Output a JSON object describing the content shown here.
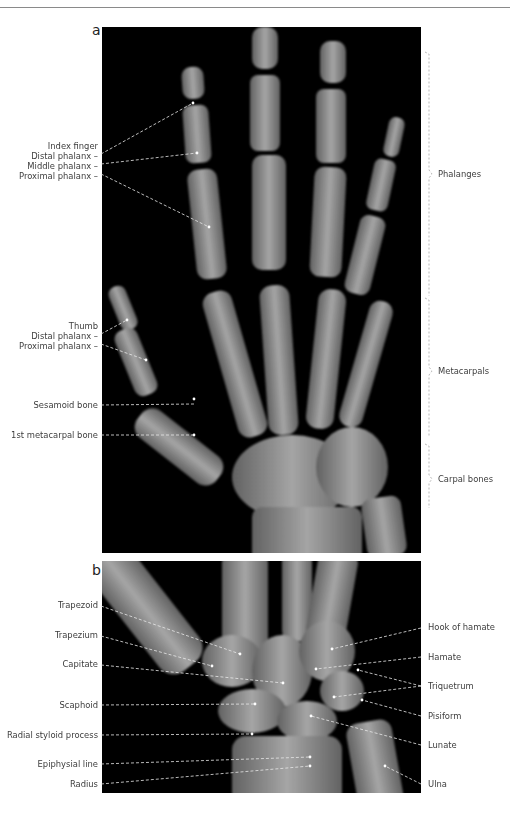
{
  "figure": {
    "panel_a": {
      "letter": "a",
      "left_labels": [
        {
          "text": "Index finger",
          "x": 98,
          "y": 141
        },
        {
          "text": "Distal phalanx –",
          "x": 98,
          "y": 151
        },
        {
          "text": "Middle phalanx –",
          "x": 98,
          "y": 161
        },
        {
          "text": "Proximal phalanx –",
          "x": 98,
          "y": 171
        },
        {
          "text": "Thumb",
          "x": 98,
          "y": 321
        },
        {
          "text": "Distal phalanx –",
          "x": 98,
          "y": 331
        },
        {
          "text": "Proximal phalanx –",
          "x": 98,
          "y": 341
        },
        {
          "text": "Sesamoid bone",
          "x": 98,
          "y": 400
        },
        {
          "text": "1st metacarpal bone",
          "x": 98,
          "y": 430
        }
      ],
      "right_labels": [
        {
          "text": "Phalanges",
          "y": 172
        },
        {
          "text": "Metacarpals",
          "y": 369
        },
        {
          "text": "Carpal bones",
          "y": 477
        }
      ]
    },
    "panel_b": {
      "letter": "b",
      "left_labels": [
        {
          "text": "Trapezoid",
          "y": 600
        },
        {
          "text": "Trapezium",
          "y": 630
        },
        {
          "text": "Capitate",
          "y": 659
        },
        {
          "text": "Scaphoid",
          "y": 701
        },
        {
          "text": "Radial styloid process",
          "y": 731
        },
        {
          "text": "Epiphysial line",
          "y": 761
        },
        {
          "text": "Radius",
          "y": 781
        }
      ],
      "right_labels": [
        {
          "text": "Hook of hamate",
          "y": 623
        },
        {
          "text": "Hamate",
          "y": 652
        },
        {
          "text": "Triquetrum",
          "y": 683
        },
        {
          "text": "Pisiform",
          "y": 712
        },
        {
          "text": "Lunate",
          "y": 742
        },
        {
          "text": "Ulna",
          "y": 781
        }
      ]
    }
  }
}
